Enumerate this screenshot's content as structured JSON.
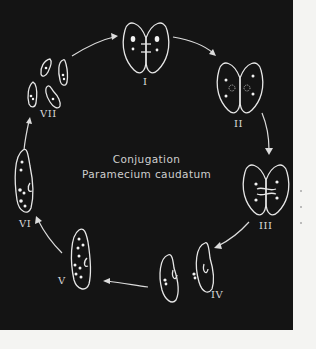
{
  "diagram": {
    "title_line1": "Conjugation",
    "title_line2": "Paramecium caudatum",
    "stages": [
      {
        "id": "I",
        "label": "I"
      },
      {
        "id": "II",
        "label": "II"
      },
      {
        "id": "III",
        "label": "III"
      },
      {
        "id": "IV",
        "label": "IV"
      },
      {
        "id": "V",
        "label": "V"
      },
      {
        "id": "VI",
        "label": "VI"
      },
      {
        "id": "VII",
        "label": "VII"
      }
    ],
    "colors": {
      "background": "#141414",
      "line": "#e6e6e6",
      "page": "#f4f4f2"
    }
  }
}
